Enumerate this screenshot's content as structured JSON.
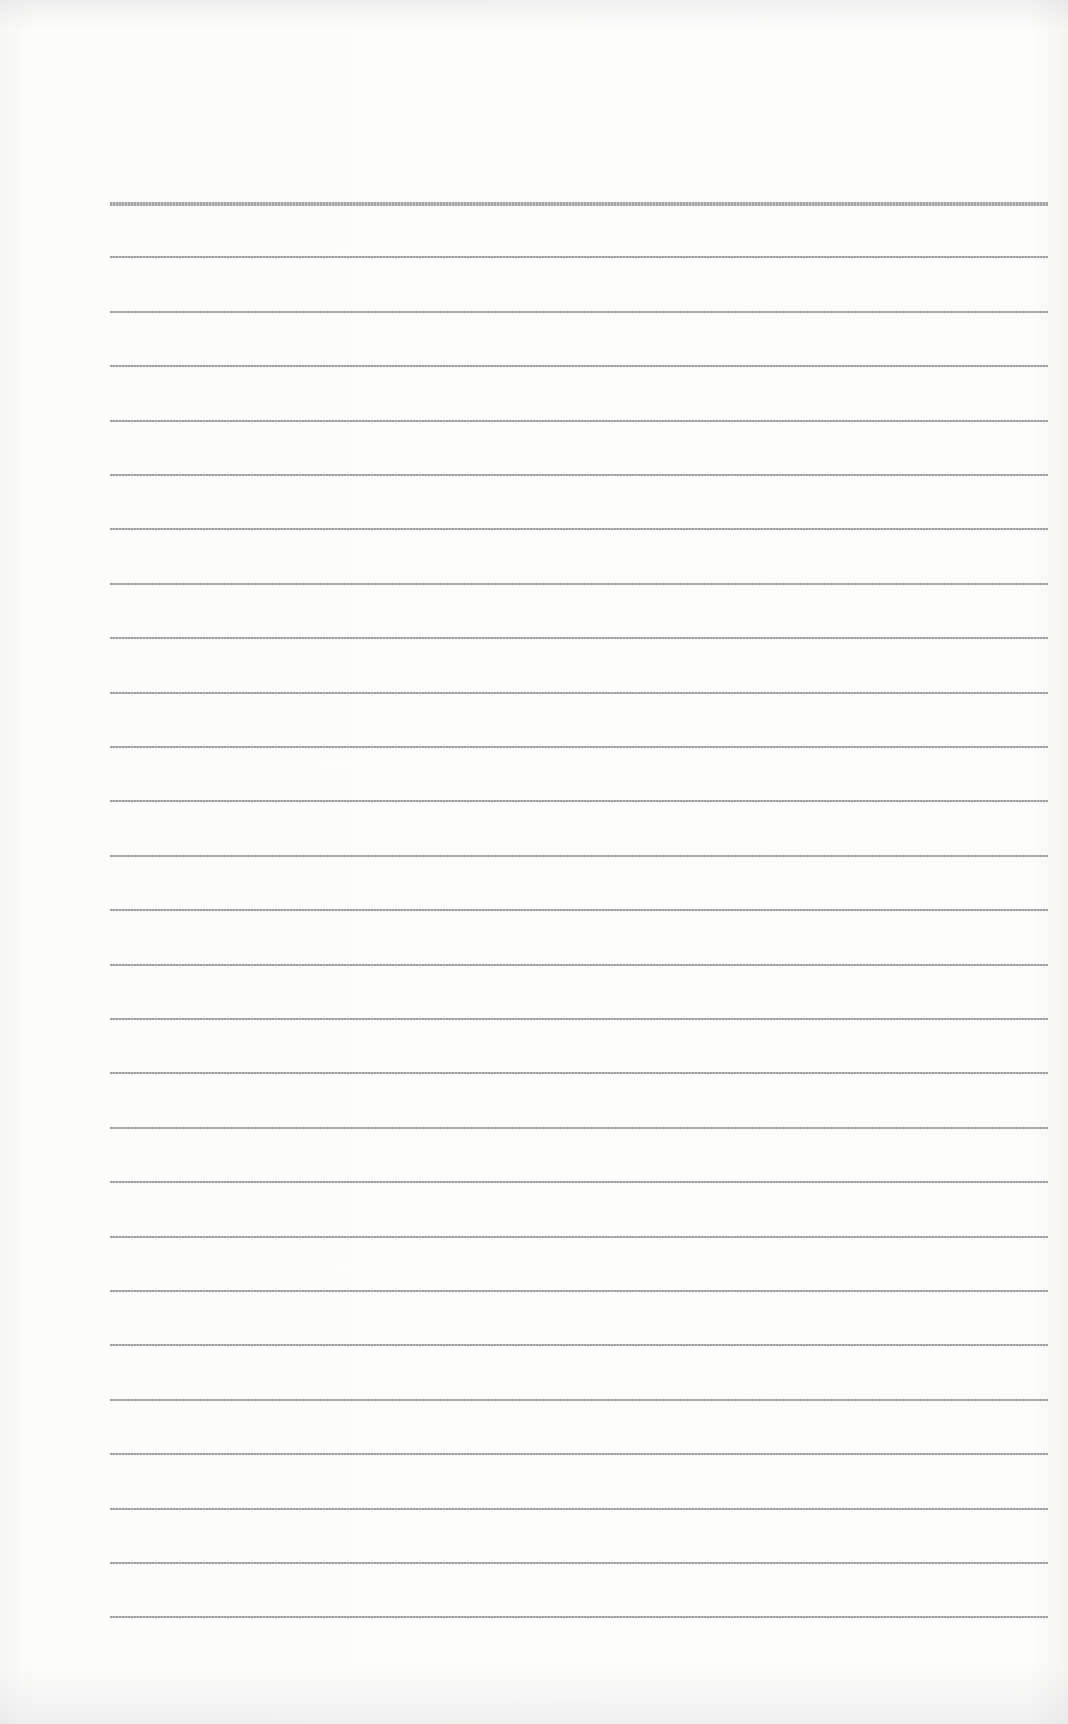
{
  "document": {
    "type": "lined-paper",
    "colors": {
      "paper": "#fcfcfb",
      "rule": "#9a9a9a"
    },
    "rules": {
      "count": 27,
      "first_y": 202,
      "spacing": 54.4,
      "left_x": 110,
      "right_x": 1048,
      "first_rule_heavy": true
    }
  }
}
